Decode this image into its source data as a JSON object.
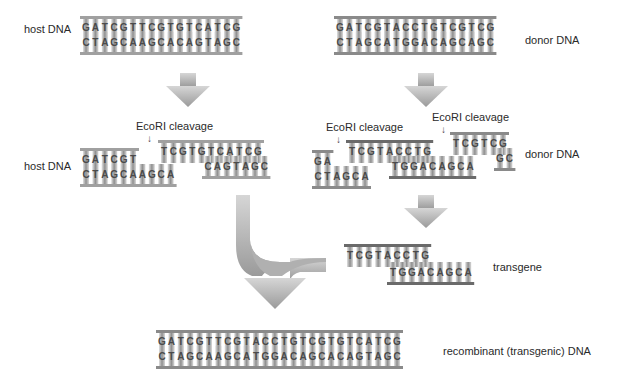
{
  "labels": {
    "host_dna_top": "host DNA",
    "donor_dna_top": "donor DNA",
    "host_dna_cut": "host DNA",
    "donor_dna_cut": "donor DNA",
    "ecori_1": "EcoRI cleavage",
    "ecori_2": "EcoRI cleavage",
    "ecori_3": "EcoRI cleavage",
    "transgene": "transgene",
    "recombinant": "recombinant (transgenic) DNA"
  },
  "sequences": {
    "host_top": "GATCGTTCGTGTCATCG",
    "host_bottom": "CTAGCAAGCACAGTAGC",
    "donor_top": "GATCGTACCTGTCGTCG",
    "donor_bottom": "CTAGCATGGACAGCAGC",
    "host_cut_left_top": "GATCGT",
    "host_cut_left_bottom": "CTAGCAAGCA",
    "host_cut_right_top": "TCGTGTCATCG",
    "host_cut_right_bottom": "CAGTAGC",
    "donor_cut_left_top": "GA",
    "donor_cut_left_bottom": "CTAGCA",
    "donor_cut_mid_top": "TCGTACCTG",
    "donor_cut_mid_bottom": "TGGACAGCA",
    "donor_cut_right_top": "TCGTCG",
    "donor_cut_right_bottom": "GC",
    "transgene_top": "TCGTACCTG",
    "transgene_bottom": "TGGACAGCA",
    "recombinant_top": "GATCGTTCGTACCTGTCGTGTCATCG",
    "recombinant_bottom": "CTAGCAAGCATGGACAGCACAGTAGC"
  },
  "colors": {
    "arrow": "#a8a8a8",
    "backbone": "#9a9a9a",
    "backbone_dark": "#6a6a6a",
    "text": "#2a2a2a"
  }
}
